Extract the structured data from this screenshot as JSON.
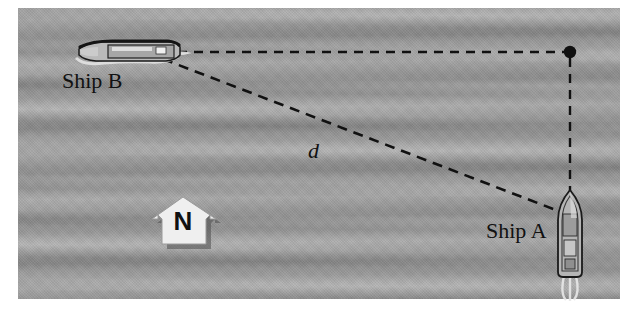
{
  "scene": {
    "title": "Two ships navigation diagram",
    "background_color": "#9a9a9a",
    "frame_color": "#ffffff"
  },
  "labels": {
    "ship_b": "Ship B",
    "ship_a": "Ship A",
    "distance": "d",
    "compass_north": "N"
  },
  "icons": {
    "compass": "north-arrow-icon",
    "ship_b": "ship-side-view-icon",
    "ship_a": "ship-top-view-icon",
    "corner_point": "vertex-dot-icon"
  },
  "geometry": {
    "ship_b_position": {
      "x": 128,
      "y": 51
    },
    "ship_a_position": {
      "x": 570,
      "y": 235
    },
    "corner_vertex": {
      "x": 570,
      "y": 52
    },
    "lines": [
      {
        "name": "bearing-line-horizontal",
        "from": {
          "x": 178,
          "y": 52
        },
        "to": {
          "x": 566,
          "y": 52
        },
        "style": "dashed"
      },
      {
        "name": "bearing-line-vertical",
        "from": {
          "x": 570,
          "y": 57
        },
        "to": {
          "x": 570,
          "y": 192
        },
        "style": "dashed"
      },
      {
        "name": "distance-line",
        "from": {
          "x": 164,
          "y": 60
        },
        "to": {
          "x": 561,
          "y": 212
        },
        "style": "dashed"
      }
    ],
    "dash_color": "#111111",
    "dash_width": 2
  }
}
